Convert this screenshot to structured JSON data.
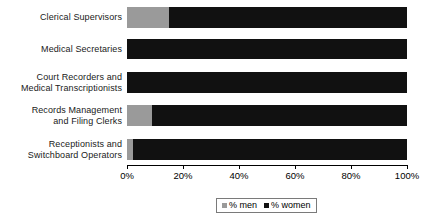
{
  "chart_data": {
    "type": "bar",
    "orientation": "horizontal",
    "stacked": true,
    "title": "",
    "xlabel": "",
    "ylabel": "",
    "xlim": [
      0,
      100
    ],
    "grid": false,
    "legend_position": "bottom",
    "categories": [
      "Clerical Supervisors",
      "Medical Secretaries",
      "Court Recorders and Medical Transcriptionists",
      "Records Management and Filing Clerks",
      "Receptionists and Switchboard Operators"
    ],
    "category_lines": [
      [
        "Clerical Supervisors"
      ],
      [
        "Medical Secretaries"
      ],
      [
        "Court Recorders and",
        "Medical Transcriptionists"
      ],
      [
        "Records Management",
        "and Filing Clerks"
      ],
      [
        "Receptionists and",
        "Switchboard Operators"
      ]
    ],
    "series": [
      {
        "name": "% men",
        "color": "#9a9a9a",
        "values": [
          15,
          0,
          0,
          9,
          2
        ]
      },
      {
        "name": "% women",
        "color": "#111111",
        "values": [
          85,
          100,
          100,
          91,
          98
        ]
      }
    ],
    "xticks": [
      0,
      20,
      40,
      60,
      80,
      100
    ],
    "xtick_labels": [
      "0%",
      "20%",
      "40%",
      "60%",
      "80%",
      "100%"
    ]
  },
  "legend": {
    "items": [
      {
        "label": "% men",
        "swatch": "men-swatch-icon"
      },
      {
        "label": "% women",
        "swatch": "women-swatch-icon"
      }
    ]
  }
}
